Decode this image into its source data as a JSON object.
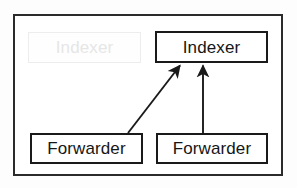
{
  "diagram": {
    "type": "node-link",
    "background_color": "#fdfdfd",
    "container": {
      "name": "deployment-container",
      "border_color": "#2b2b2b",
      "fill_color": "#ffffff"
    },
    "nodes": [
      {
        "id": "indexer-ghost",
        "label": "Indexer",
        "state": "ghost",
        "border_color": "#ededed",
        "text_color": "#e6e6e6",
        "fill_color": "#fefefe"
      },
      {
        "id": "indexer",
        "label": "Indexer",
        "state": "solid",
        "border_color": "#1a1a1a",
        "text_color": "#161616",
        "fill_color": "#ffffff"
      },
      {
        "id": "forwarder-left",
        "label": "Forwarder",
        "state": "solid",
        "border_color": "#1a1a1a",
        "text_color": "#161616",
        "fill_color": "#ffffff"
      },
      {
        "id": "forwarder-right",
        "label": "Forwarder",
        "state": "solid",
        "border_color": "#1a1a1a",
        "text_color": "#161616",
        "fill_color": "#ffffff"
      }
    ],
    "connectors": [
      {
        "id": "forwarder-left-to-indexer",
        "from": "forwarder-left",
        "to": "indexer",
        "style": "diagonal",
        "arrowhead": "solid-filled",
        "color": "#1a1a1a"
      },
      {
        "id": "forwarder-right-to-indexer",
        "from": "forwarder-right",
        "to": "indexer",
        "style": "vertical",
        "arrowhead": "solid-filled",
        "color": "#1a1a1a"
      }
    ]
  }
}
